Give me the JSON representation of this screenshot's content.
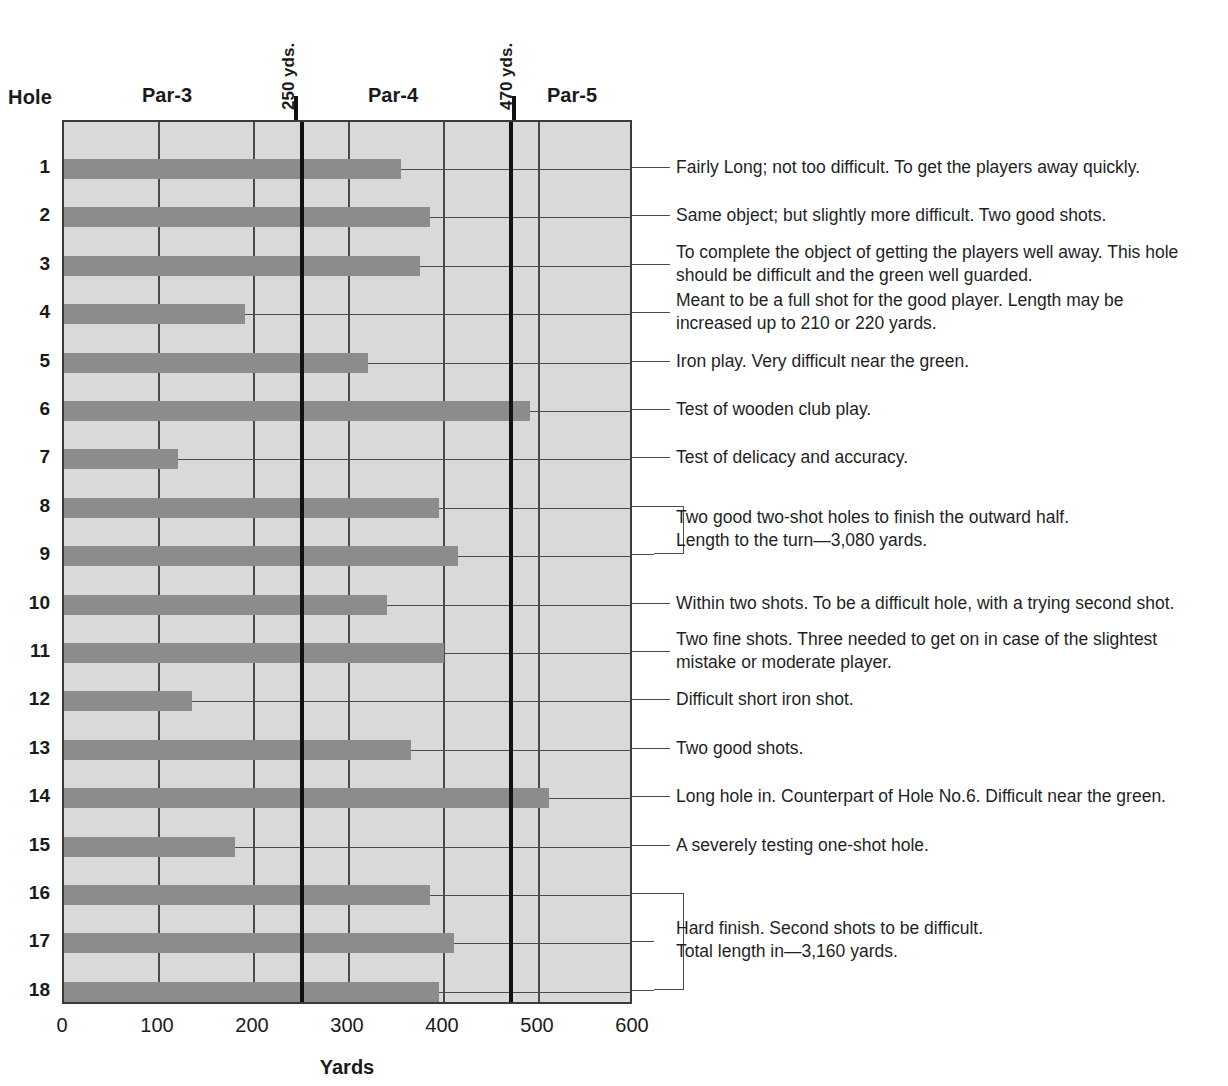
{
  "header": {
    "hole_label": "Hole",
    "par_labels": [
      {
        "text": "Par-3",
        "x": 167
      },
      {
        "text": "Par-4",
        "x": 393
      },
      {
        "text": "Par-5",
        "x": 572
      }
    ],
    "marker_labels": [
      {
        "text": "250 yds.",
        "value": 250
      },
      {
        "text": "470 yds.",
        "value": 470
      }
    ]
  },
  "axis": {
    "title": "Yards",
    "ticks": [
      0,
      100,
      200,
      300,
      400,
      500,
      600
    ],
    "tick_labels": [
      "0",
      "100",
      "200",
      "300",
      "400",
      "500",
      "600"
    ],
    "min": 0,
    "max": 600
  },
  "colors": {
    "bar": "#8c8c8c",
    "plot_background": "#d9d9d9",
    "grid": "#4a4a4a",
    "marker_line": "#111111",
    "text": "#1a1a1a"
  },
  "chart_data": {
    "type": "bar",
    "orientation": "horizontal",
    "title": "",
    "xlabel": "Yards",
    "ylabel": "Hole",
    "xlim": [
      0,
      600
    ],
    "grid": true,
    "legend": "none",
    "categories": [
      "1",
      "2",
      "3",
      "4",
      "5",
      "6",
      "7",
      "8",
      "9",
      "10",
      "11",
      "12",
      "13",
      "14",
      "15",
      "16",
      "17",
      "18"
    ],
    "values": [
      355,
      385,
      375,
      190,
      320,
      490,
      120,
      395,
      415,
      340,
      400,
      135,
      365,
      510,
      180,
      385,
      410,
      395
    ],
    "annotations": [
      {
        "label": "250 yds.",
        "x": 250
      },
      {
        "label": "470 yds.",
        "x": 470
      },
      {
        "label": "Par-3",
        "region": [
          0,
          250
        ]
      },
      {
        "label": "Par-4",
        "region": [
          250,
          470
        ]
      },
      {
        "label": "Par-5",
        "region": [
          470,
          600
        ]
      },
      {
        "label": "Length to the turn—3,080 yards."
      },
      {
        "label": "Total length in—3,160 yards."
      }
    ]
  },
  "holes": [
    {
      "num": "1",
      "yards": 355,
      "note": "Fairly Long; not too difficult. To get the players away quickly."
    },
    {
      "num": "2",
      "yards": 385,
      "note": "Same object; but slightly more difficult. Two good shots."
    },
    {
      "num": "3",
      "yards": 375,
      "note": "To complete the object of getting the players well away. This hole\nshould be difficult and the green well guarded."
    },
    {
      "num": "4",
      "yards": 190,
      "note": "Meant to be a full shot for the good player. Length may be\nincreased up to 210 or 220 yards."
    },
    {
      "num": "5",
      "yards": 320,
      "note": "Iron play. Very difficult near the green."
    },
    {
      "num": "6",
      "yards": 490,
      "note": "Test of wooden club play."
    },
    {
      "num": "7",
      "yards": 120,
      "note": "Test of delicacy and accuracy."
    },
    {
      "num": "8",
      "yards": 395,
      "note": ""
    },
    {
      "num": "9",
      "yards": 415,
      "note": ""
    },
    {
      "num": "10",
      "yards": 340,
      "note": "Within two shots. To be a difficult hole, with a trying second shot."
    },
    {
      "num": "11",
      "yards": 400,
      "note": "Two fine shots. Three needed to get on in case of the slightest\nmistake or moderate player."
    },
    {
      "num": "12",
      "yards": 135,
      "note": "Difficult short iron shot."
    },
    {
      "num": "13",
      "yards": 365,
      "note": "Two good shots."
    },
    {
      "num": "14",
      "yards": 510,
      "note": "Long hole in. Counterpart of Hole No.6. Difficult near the green."
    },
    {
      "num": "15",
      "yards": 180,
      "note": "A severely testing one-shot hole."
    },
    {
      "num": "16",
      "yards": 385,
      "note": ""
    },
    {
      "num": "17",
      "yards": 410,
      "note": ""
    },
    {
      "num": "18",
      "yards": 395,
      "note": ""
    }
  ],
  "grouped_notes": [
    {
      "id": "outward-finish",
      "holes": [
        "8",
        "9"
      ],
      "text": "Two good two-shot holes to finish the outward half.\nLength to the turn—3,080 yards."
    },
    {
      "id": "inward-finish",
      "holes": [
        "16",
        "17",
        "18"
      ],
      "text": "Hard finish. Second shots to be difficult.\nTotal length in—3,160 yards."
    }
  ]
}
